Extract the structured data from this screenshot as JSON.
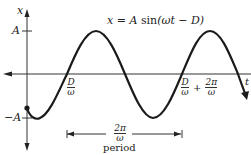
{
  "diagram": {
    "equation": {
      "lhs": "x",
      "eq": "=",
      "amp": "A",
      "fn": "sin",
      "arg": "(ωt − D)"
    },
    "axes": {
      "vertical_label": "x",
      "horizontal_label": "t",
      "ticks": {
        "top": "A",
        "bottom": "−A"
      }
    },
    "markers": {
      "first_zero": {
        "num": "D",
        "den": "ω"
      },
      "second_zero": {
        "num1": "D",
        "den1": "ω",
        "plus": "+",
        "num2": "2π",
        "den2": "ω"
      }
    },
    "period": {
      "fraction_num": "2π",
      "fraction_den": "ω",
      "label": "period"
    },
    "colors": {
      "stroke": "#1a1a1a",
      "axis": "#333333"
    }
  }
}
